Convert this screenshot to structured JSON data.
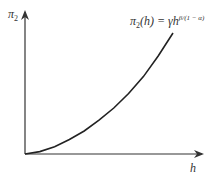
{
  "chart_data": {
    "type": "line",
    "title": "",
    "xlabel": "h",
    "ylabel": "π2",
    "annotation": "π2(h) = γh^(β/(1−α))",
    "grid": false,
    "legend": "none",
    "series": [
      {
        "name": "π2(h) = γh^(β/(1−α))",
        "x": [
          0,
          0.1,
          0.2,
          0.3,
          0.4,
          0.5,
          0.6,
          0.7,
          0.8,
          0.9,
          1.0
        ],
        "values": [
          0,
          0.02,
          0.06,
          0.12,
          0.19,
          0.28,
          0.38,
          0.5,
          0.64,
          0.81,
          1.0
        ]
      }
    ],
    "xlim": [
      0,
      1.15
    ],
    "ylim": [
      0,
      1.2
    ]
  },
  "labels": {
    "y_axis": "π",
    "y_axis_sub": "2",
    "x_axis": "h",
    "eq_pi": "π",
    "eq_sub": "2",
    "eq_mid": "(h) = γh",
    "eq_exp": "β/(1 − α)"
  },
  "colors": {
    "axis": "#333333",
    "curve": "#222222"
  }
}
